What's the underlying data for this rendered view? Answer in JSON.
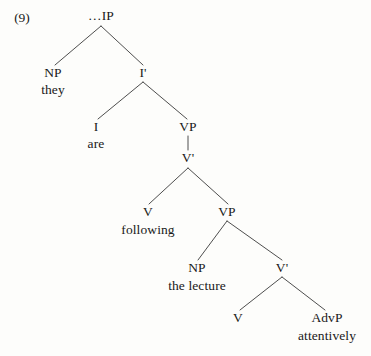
{
  "figure": {
    "example_number": "(9)",
    "type": "syntax-tree",
    "sentence": "they are following the lecture attentively",
    "ink_color": "#191919",
    "line_color": "#3a3a3a",
    "background_color": "#fdfdfb"
  },
  "nodes": [
    {
      "id": "ip",
      "label": "…IP",
      "x": 101,
      "y": 16
    },
    {
      "id": "np1",
      "label": "NP",
      "x": 53,
      "y": 73
    },
    {
      "id": "ibar",
      "label": "I'",
      "x": 143,
      "y": 73
    },
    {
      "id": "i",
      "label": "I",
      "x": 96,
      "y": 127
    },
    {
      "id": "vp1",
      "label": "VP",
      "x": 188,
      "y": 127
    },
    {
      "id": "vbar1",
      "label": "V'",
      "x": 188,
      "y": 158
    },
    {
      "id": "v1",
      "label": "V",
      "x": 148,
      "y": 212
    },
    {
      "id": "vp2",
      "label": "VP",
      "x": 227,
      "y": 212
    },
    {
      "id": "np2",
      "label": "NP",
      "x": 197,
      "y": 268
    },
    {
      "id": "vbar2",
      "label": "V'",
      "x": 282,
      "y": 268
    },
    {
      "id": "v2",
      "label": "V",
      "x": 238,
      "y": 318
    },
    {
      "id": "advp",
      "label": "AdvP",
      "x": 327,
      "y": 318
    }
  ],
  "terminals": [
    {
      "id": "t-they",
      "label": "they",
      "x": 53,
      "y": 90
    },
    {
      "id": "t-are",
      "label": "are",
      "x": 96,
      "y": 144
    },
    {
      "id": "t-following",
      "label": "following",
      "x": 148,
      "y": 230
    },
    {
      "id": "t-the-lecture",
      "label": "the lecture",
      "x": 197,
      "y": 286
    },
    {
      "id": "t-attentively",
      "label": "attentively",
      "x": 327,
      "y": 336
    }
  ],
  "edges": [
    {
      "id": "ip-np1",
      "from": "ip",
      "to": "np1",
      "x1": 101,
      "y1": 26,
      "x2": 55,
      "y2": 65
    },
    {
      "id": "ip-ibar",
      "from": "ip",
      "to": "ibar",
      "x1": 101,
      "y1": 26,
      "x2": 143,
      "y2": 65
    },
    {
      "id": "ibar-i",
      "from": "ibar",
      "to": "i",
      "x1": 143,
      "y1": 82,
      "x2": 98,
      "y2": 119
    },
    {
      "id": "ibar-vp1",
      "from": "ibar",
      "to": "vp1",
      "x1": 143,
      "y1": 82,
      "x2": 187,
      "y2": 119
    },
    {
      "id": "vp1-vbar1",
      "from": "vp1",
      "to": "vbar1",
      "x1": 188,
      "y1": 136,
      "x2": 188,
      "y2": 150
    },
    {
      "id": "vbar1-v1",
      "from": "vbar1",
      "to": "v1",
      "x1": 188,
      "y1": 168,
      "x2": 149,
      "y2": 204
    },
    {
      "id": "vbar1-vp2",
      "from": "vbar1",
      "to": "vp2",
      "x1": 188,
      "y1": 168,
      "x2": 228,
      "y2": 204
    },
    {
      "id": "vp2-np2",
      "from": "vp2",
      "to": "np2",
      "x1": 227,
      "y1": 221,
      "x2": 198,
      "y2": 260
    },
    {
      "id": "vp2-vbar2",
      "from": "vp2",
      "to": "vbar2",
      "x1": 227,
      "y1": 221,
      "x2": 282,
      "y2": 260
    },
    {
      "id": "vbar2-v2",
      "from": "vbar2",
      "to": "v2",
      "x1": 282,
      "y1": 277,
      "x2": 240,
      "y2": 310
    },
    {
      "id": "vbar2-advp",
      "from": "vbar2",
      "to": "advp",
      "x1": 282,
      "y1": 277,
      "x2": 325,
      "y2": 310
    }
  ]
}
